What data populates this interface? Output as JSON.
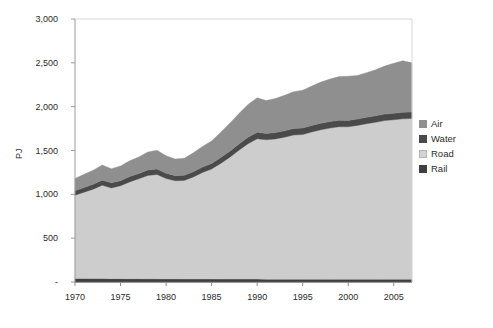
{
  "chart_data": {
    "type": "area",
    "stacked": true,
    "title": "",
    "subtitle": "",
    "xlabel": "",
    "ylabel": "PJ",
    "xlim": [
      1970,
      2007
    ],
    "ylim": [
      0,
      3000
    ],
    "grid": false,
    "legend_position": "right",
    "y_ticks": [
      0,
      500,
      1000,
      1500,
      2000,
      2500,
      3000
    ],
    "y_tick_labels": [
      "-",
      "500",
      "1,000",
      "1,500",
      "2,000",
      "2,500",
      "3,000"
    ],
    "x_ticks": [
      1970,
      1975,
      1980,
      1985,
      1990,
      1995,
      2000,
      2005
    ],
    "x_tick_labels": [
      "1970",
      "1975",
      "1980",
      "1985",
      "1990",
      "1995",
      "2000",
      "2005"
    ],
    "x": [
      1970,
      1971,
      1972,
      1973,
      1974,
      1975,
      1976,
      1977,
      1978,
      1979,
      1980,
      1981,
      1982,
      1983,
      1984,
      1985,
      1986,
      1987,
      1988,
      1989,
      1990,
      1991,
      1992,
      1993,
      1994,
      1995,
      1996,
      1997,
      1998,
      1999,
      2000,
      2001,
      2002,
      2003,
      2004,
      2005,
      2006,
      2007
    ],
    "stack_order": [
      "Rail",
      "Road",
      "Water",
      "Air"
    ],
    "series": [
      {
        "name": "Rail",
        "color": "#3f3f3f",
        "values": [
          40,
          40,
          39,
          39,
          38,
          38,
          37,
          37,
          36,
          36,
          35,
          35,
          34,
          34,
          34,
          34,
          33,
          33,
          33,
          33,
          33,
          32,
          32,
          32,
          32,
          32,
          32,
          31,
          31,
          31,
          31,
          31,
          31,
          31,
          31,
          31,
          31,
          31
        ]
      },
      {
        "name": "Road",
        "color": "#cdcdcd",
        "values": [
          950,
          985,
          1020,
          1065,
          1035,
          1060,
          1105,
          1140,
          1180,
          1190,
          1145,
          1120,
          1125,
          1165,
          1215,
          1255,
          1320,
          1390,
          1470,
          1545,
          1600,
          1590,
          1600,
          1620,
          1645,
          1650,
          1680,
          1705,
          1725,
          1740,
          1740,
          1755,
          1775,
          1790,
          1810,
          1820,
          1830,
          1835
        ]
      },
      {
        "name": "Water",
        "color": "#4a4a4a",
        "values": [
          52,
          54,
          56,
          58,
          58,
          58,
          60,
          60,
          62,
          62,
          60,
          58,
          58,
          60,
          62,
          64,
          66,
          68,
          70,
          72,
          74,
          72,
          72,
          72,
          74,
          74,
          74,
          74,
          74,
          74,
          72,
          72,
          72,
          74,
          74,
          74,
          74,
          74
        ]
      },
      {
        "name": "Air",
        "color": "#8f8f8f",
        "values": [
          140,
          150,
          160,
          172,
          160,
          168,
          180,
          190,
          205,
          215,
          200,
          190,
          195,
          215,
          235,
          255,
          290,
          320,
          350,
          375,
          395,
          375,
          390,
          405,
          420,
          432,
          450,
          470,
          485,
          498,
          505,
          498,
          510,
          525,
          548,
          570,
          588,
          560
        ]
      }
    ],
    "totals": [
      1182,
      1229,
      1275,
      1334,
      1291,
      1324,
      1382,
      1427,
      1483,
      1503,
      1440,
      1403,
      1412,
      1474,
      1546,
      1608,
      1709,
      1811,
      1923,
      2025,
      2102,
      2069,
      2094,
      2129,
      2171,
      2188,
      2236,
      2280,
      2315,
      2343,
      2348,
      2356,
      2388,
      2420,
      2463,
      2495,
      2523,
      2500
    ]
  },
  "legend": {
    "items": [
      {
        "label": "Air",
        "color": "#8f8f8f"
      },
      {
        "label": "Water",
        "color": "#4a4a4a"
      },
      {
        "label": "Road",
        "color": "#d3d3d3"
      },
      {
        "label": "Rail",
        "color": "#3f3f3f"
      }
    ]
  },
  "axes": {
    "y_title": "PJ",
    "y_labels": [
      "3,000",
      "2,500",
      "2,000",
      "1,500",
      "1,000",
      "500",
      "-"
    ],
    "x_labels": [
      "1970",
      "1975",
      "1980",
      "1985",
      "1990",
      "1995",
      "2000",
      "2005"
    ]
  },
  "colors": {
    "background": "#ffffff",
    "plot_background": "#ffffff",
    "axis_line": "#9c9c9c",
    "text": "#2b2b2b",
    "air": "#8f8f8f",
    "water": "#4a4a4a",
    "road": "#cdcdcd",
    "rail": "#3f3f3f"
  }
}
